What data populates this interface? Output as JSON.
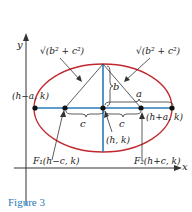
{
  "figure": {
    "caption": "Figure 3",
    "axes": {
      "x_label": "x",
      "y_label": "y"
    },
    "labels": {
      "left_vertex": "(h−a, k)",
      "right_vertex": "(h+a, k)",
      "center": "(h, k)",
      "focus1": "F₁(h−c, k)",
      "focus2": "F₂(h+c, k)",
      "left_focal_segment": "√(b² + c²)",
      "right_focal_segment": "√(b² + c²)",
      "semi_minor": "b",
      "semi_major": "a",
      "focal_dist_left": "c",
      "focal_dist_right": "c"
    },
    "colors": {
      "ellipse": "#c0282d",
      "axes_lines": "#2a7ab8",
      "caption": "#2a7ab8"
    }
  }
}
